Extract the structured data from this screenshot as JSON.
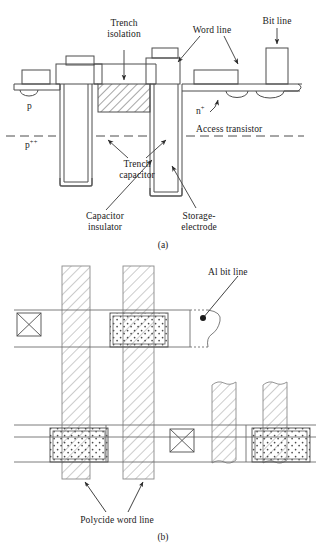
{
  "figure": {
    "panels": [
      {
        "id": "a",
        "caption": "(a)",
        "type": "cross-section"
      },
      {
        "id": "b",
        "caption": "(b)",
        "type": "layout-plan-view"
      }
    ]
  },
  "panel_a": {
    "caption": "(a)",
    "labels": {
      "trench_isolation": "Trench\nisolation",
      "trench_isolation_line1": "Trench",
      "trench_isolation_line2": "isolation",
      "word_line": "Word line",
      "bit_line": "Bit line",
      "access_transistor": "Access transistor",
      "n_plus": "n",
      "n_plus_sup": "+",
      "p_region": "p",
      "p_plus_plus": "p",
      "p_plus_plus_sup": "++",
      "trench_capacitor_line1": "Trench",
      "trench_capacitor_line2": "capacitor",
      "capacitor_insulator_line1": "Capacitor",
      "capacitor_insulator_line2": "insulator",
      "storage_electrode_line1": "Storage-",
      "storage_electrode_line2": "electrode"
    }
  },
  "panel_b": {
    "caption": "(b)",
    "labels": {
      "al_bit_line": "Al bit line",
      "polycide_word_line": "Polycide word line"
    }
  },
  "colors": {
    "line": "#4d4d4d",
    "dark_line": "#333333",
    "hatch": "#808080",
    "text": "#1a1a1a",
    "background": "#ffffff",
    "dot_fill": "#555555"
  }
}
